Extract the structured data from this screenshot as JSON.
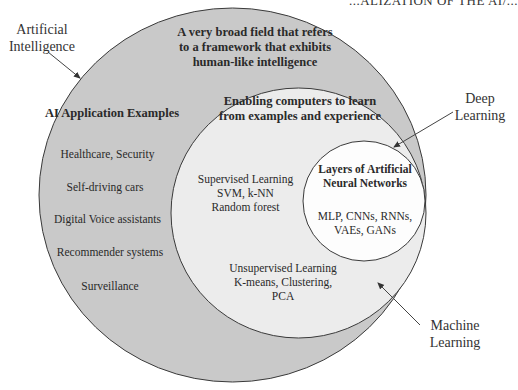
{
  "header": {
    "text": "...ALIZATION OF THE AI/..."
  },
  "colors": {
    "ai_fill": "#c9c9c9",
    "ml_fill": "#ececec",
    "dl_fill": "#fdfdfd",
    "stroke": "#3a3a3a",
    "arrow": "#444444"
  },
  "labels": {
    "ai": {
      "line1": "Artificial",
      "line2": "Intelligence"
    },
    "dl": {
      "line1": "Deep",
      "line2": "Learning"
    },
    "ml": {
      "line1": "Machine",
      "line2": "Learning"
    }
  },
  "ai_circle": {
    "description": [
      "A very broad field that refers",
      "to a framework that exhibits",
      "human-like intelligence"
    ],
    "examples_title": "AI Application Examples",
    "examples": [
      "Healthcare, Security",
      "Self-driving cars",
      "Digital Voice assistants",
      "Recommender systems",
      "Surveillance"
    ]
  },
  "ml_circle": {
    "description": [
      "Enabling computers to learn",
      "from examples and experience"
    ],
    "supervised": [
      "Supervised Learning",
      "SVM, k-NN",
      "Random forest"
    ],
    "unsupervised": [
      "Unsupervised Learning",
      "K-means, Clustering,",
      "PCA"
    ]
  },
  "dl_circle": {
    "description": [
      "Layers of Artificial",
      "Neural Networks"
    ],
    "examples": [
      "MLP, CNNs, RNNs,",
      "VAEs, GANs"
    ]
  }
}
